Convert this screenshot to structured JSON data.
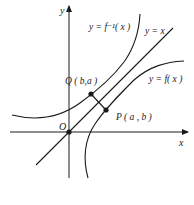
{
  "diagram": {
    "axes": {
      "x_label": "x",
      "y_label": "y",
      "origin_label": "O"
    },
    "curves": {
      "inverse_label": "y = f⁻¹( x )",
      "identity_label": "y = x",
      "function_label": "y = f( x )"
    },
    "points": {
      "Q_label": "Q ( b,a )",
      "P_label": "P ( a , b )"
    },
    "colors": {
      "stroke": "#1a1a1a",
      "background": "#ffffff"
    }
  }
}
